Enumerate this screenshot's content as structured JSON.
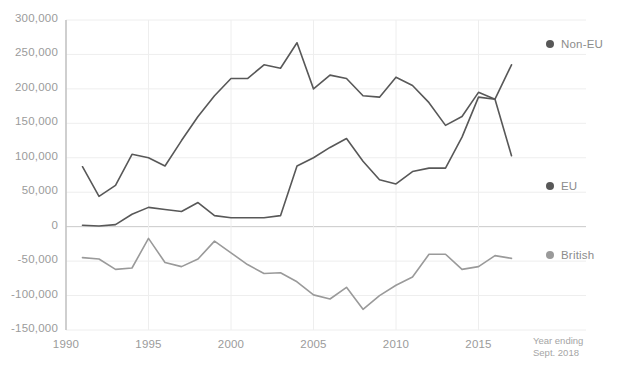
{
  "chart_data": {
    "type": "line",
    "title": "",
    "xlabel": "",
    "ylabel": "",
    "xlim": [
      1990,
      2018
    ],
    "ylim": [
      -150000,
      300000
    ],
    "grid": true,
    "legend_position": "right",
    "x_ticks": [
      "1990",
      "1995",
      "2000",
      "2005",
      "2010",
      "2015"
    ],
    "x_tick_values": [
      1990,
      1995,
      2000,
      2005,
      2010,
      2015
    ],
    "y_ticks": [
      "300,000",
      "250,000",
      "200,000",
      "150,000",
      "100,000",
      "50,000",
      "0",
      "-50,000",
      "-100,000",
      "-150,000"
    ],
    "y_tick_values": [
      300000,
      250000,
      200000,
      150000,
      100000,
      50000,
      0,
      -50000,
      -100000,
      -150000
    ],
    "annotation": "Year ending\nSept. 2018",
    "annotation_line1": "Year ending",
    "annotation_line2": "Sept. 2018",
    "x": [
      1991,
      1992,
      1993,
      1994,
      1995,
      1996,
      1997,
      1998,
      1999,
      2000,
      2001,
      2002,
      2003,
      2004,
      2005,
      2006,
      2007,
      2008,
      2009,
      2010,
      2011,
      2012,
      2013,
      2014,
      2015,
      2016,
      2017
    ],
    "series": [
      {
        "name": "Non-EU",
        "color": "#585858",
        "values": [
          87000,
          44000,
          60000,
          105000,
          100000,
          88000,
          125000,
          160000,
          190000,
          215000,
          215000,
          235000,
          230000,
          267000,
          200000,
          220000,
          215000,
          190000,
          188000,
          217000,
          205000,
          180000,
          147000,
          160000,
          195000,
          185000,
          235000
        ]
      },
      {
        "name": "EU",
        "color": "#585858",
        "values": [
          2000,
          1000,
          3000,
          18000,
          28000,
          25000,
          22000,
          35000,
          16000,
          13000,
          13000,
          13000,
          16000,
          88000,
          100000,
          115000,
          128000,
          95000,
          68000,
          62000,
          80000,
          85000,
          85000,
          130000,
          188000,
          185000,
          103000
        ]
      },
      {
        "name": "British",
        "color": "#9a9a9a",
        "values": [
          -45000,
          -47000,
          -62000,
          -60000,
          -17000,
          -52000,
          -58000,
          -47000,
          -21000,
          -38000,
          -55000,
          -68000,
          -67000,
          -80000,
          -99000,
          -105000,
          -88000,
          -120000,
          -100000,
          -85000,
          -73000,
          -40000,
          -40000,
          -62000,
          -58000,
          -42000,
          -46000
        ]
      }
    ]
  },
  "legend": {
    "items": [
      {
        "label": "Non-EU",
        "color": "#585858"
      },
      {
        "label": "EU",
        "color": "#585858"
      },
      {
        "label": "British",
        "color": "#9a9a9a"
      }
    ]
  },
  "header": {
    "title": ""
  }
}
